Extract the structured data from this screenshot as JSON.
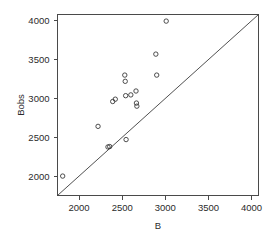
{
  "chart_data": {
    "type": "scatter",
    "title": "",
    "xlabel": "B",
    "ylabel": "Bobs",
    "xlim": [
      1750,
      4080
    ],
    "ylim": [
      1750,
      4080
    ],
    "grid": false,
    "legend": null,
    "xticks": [
      2000,
      2500,
      3000,
      3500,
      4000
    ],
    "yticks": [
      2000,
      2500,
      3000,
      3500,
      4000
    ],
    "xtick_labels": [
      "2000",
      "2500",
      "3000",
      "3500",
      "4000"
    ],
    "ytick_labels": [
      "2000",
      "2500",
      "3000",
      "3500",
      "4000"
    ],
    "marker": "open-circle",
    "marker_color": "#3a3a3a",
    "reference_line": {
      "name": "identity-line",
      "type": "y=x",
      "from": [
        1750,
        1750
      ],
      "to": [
        4080,
        4080
      ],
      "color": "#3c3c3c"
    },
    "points": [
      {
        "x": 1810,
        "y": 2000
      },
      {
        "x": 2220,
        "y": 2640
      },
      {
        "x": 2335,
        "y": 2375
      },
      {
        "x": 2355,
        "y": 2380
      },
      {
        "x": 2390,
        "y": 2960
      },
      {
        "x": 2420,
        "y": 2990
      },
      {
        "x": 2530,
        "y": 3300
      },
      {
        "x": 2535,
        "y": 3220
      },
      {
        "x": 2540,
        "y": 3035
      },
      {
        "x": 2545,
        "y": 2470
      },
      {
        "x": 2600,
        "y": 3045
      },
      {
        "x": 2660,
        "y": 3095
      },
      {
        "x": 2665,
        "y": 2940
      },
      {
        "x": 2670,
        "y": 2900
      },
      {
        "x": 2890,
        "y": 3570
      },
      {
        "x": 2900,
        "y": 3300
      },
      {
        "x": 3010,
        "y": 3995
      }
    ]
  }
}
